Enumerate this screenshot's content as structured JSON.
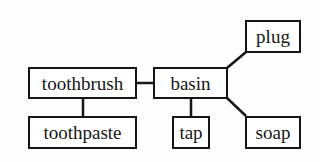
{
  "diagram": {
    "type": "association-network",
    "nodes": [
      {
        "id": "toothbrush",
        "label": "toothbrush",
        "x": 28,
        "y": 67,
        "w": 109,
        "h": 32
      },
      {
        "id": "toothpaste",
        "label": "toothpaste",
        "x": 28,
        "y": 116,
        "w": 109,
        "h": 33
      },
      {
        "id": "basin",
        "label": "basin",
        "x": 153,
        "y": 67,
        "w": 75,
        "h": 32
      },
      {
        "id": "plug",
        "label": "plug",
        "x": 245,
        "y": 20,
        "w": 56,
        "h": 33
      },
      {
        "id": "tap",
        "label": "tap",
        "x": 172,
        "y": 116,
        "w": 38,
        "h": 33
      },
      {
        "id": "soap",
        "label": "soap",
        "x": 245,
        "y": 116,
        "w": 56,
        "h": 33
      }
    ],
    "edges": [
      {
        "from": "toothbrush",
        "to": "basin"
      },
      {
        "from": "toothbrush",
        "to": "toothpaste"
      },
      {
        "from": "basin",
        "to": "plug"
      },
      {
        "from": "basin",
        "to": "tap"
      },
      {
        "from": "basin",
        "to": "soap"
      }
    ],
    "colors": {
      "stroke": "#151515",
      "background": "#fdfdfd"
    }
  }
}
